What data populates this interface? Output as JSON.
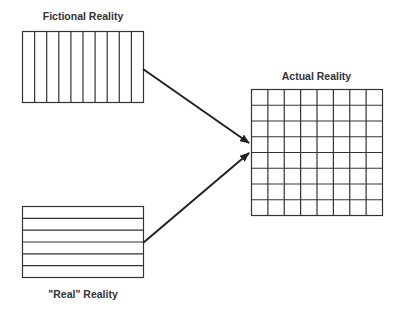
{
  "diagram": {
    "fictional": {
      "title": "Fictional Reality",
      "pattern": "vertical-lines",
      "columns": 10
    },
    "real": {
      "title": "\"Real\" Reality",
      "pattern": "horizontal-lines",
      "rows": 6
    },
    "actual": {
      "title": "Actual Reality",
      "pattern": "grid",
      "rows": 8,
      "columns": 8
    },
    "arrows": [
      {
        "from": "fictional",
        "to": "actual"
      },
      {
        "from": "real",
        "to": "actual"
      }
    ],
    "colors": {
      "stroke": "#333333",
      "text": "#333333",
      "background": "#ffffff"
    }
  }
}
